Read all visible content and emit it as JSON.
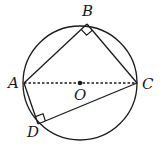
{
  "diagram": {
    "type": "geometry",
    "circle": {
      "center": "O",
      "cx": 80,
      "cy": 83,
      "r": 57
    },
    "points": {
      "A": {
        "label": "A",
        "x": 24,
        "y": 83
      },
      "B": {
        "label": "B",
        "x": 87,
        "y": 24
      },
      "C": {
        "label": "C",
        "x": 137,
        "y": 83
      },
      "D": {
        "label": "D",
        "x": 38,
        "y": 124
      },
      "O": {
        "label": "O",
        "x": 80,
        "y": 83
      }
    },
    "segments": [
      {
        "from": "A",
        "to": "B",
        "style": "solid"
      },
      {
        "from": "B",
        "to": "C",
        "style": "solid"
      },
      {
        "from": "C",
        "to": "D",
        "style": "solid"
      },
      {
        "from": "D",
        "to": "A",
        "style": "solid"
      },
      {
        "from": "A",
        "to": "C",
        "style": "dashed"
      }
    ],
    "right_angles": [
      "B",
      "D"
    ],
    "colors": {
      "stroke": "#1a1a1a",
      "background": "#ffffff"
    }
  }
}
